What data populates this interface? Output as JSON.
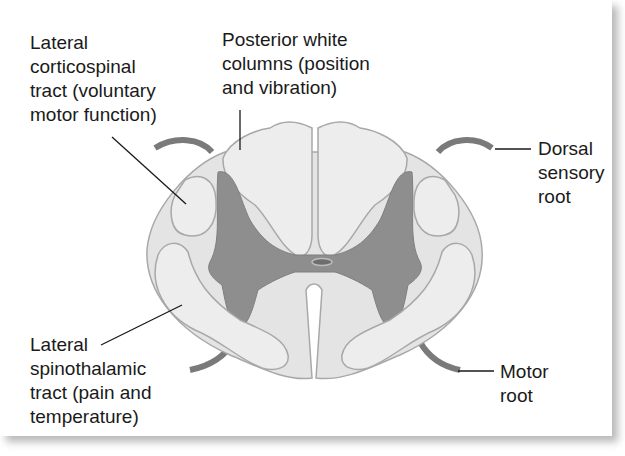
{
  "figure": {
    "colors": {
      "white_matter": "#e4e4e4",
      "tract_fill": "#ededed",
      "gray_matter": "#8e8e8e",
      "outline": "#a8a8a8",
      "nerve_root": "#7a7a7a",
      "leader_line": "#1a1a1a",
      "text": "#1a1a1a"
    },
    "labels": {
      "lateral_corticospinal": "Lateral\ncorticospinal\ntract (voluntary\nmotor function)",
      "posterior_white_columns": "Posterior white\ncolumns (position\nand vibration)",
      "dorsal_sensory_root": "Dorsal\nsensory\nroot",
      "lateral_spinothalamic": "Lateral\nspinothalamic\ntract (pain and\ntemperature)",
      "motor_root": "Motor\nroot"
    }
  }
}
